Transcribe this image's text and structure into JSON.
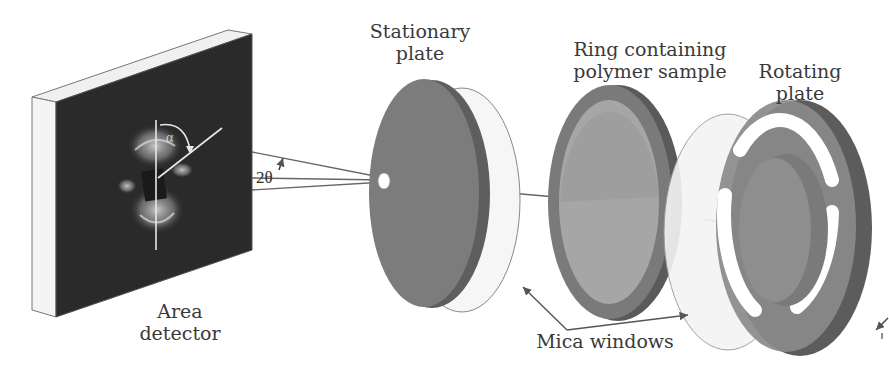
{
  "diagram": {
    "type": "schematic",
    "labels": {
      "area_detector": [
        "Area",
        "detector"
      ],
      "stationary_plate": [
        "Stationary",
        "plate"
      ],
      "ring": [
        "Ring containing",
        "polymer sample"
      ],
      "rotating_plate": [
        "Rotating",
        "plate"
      ],
      "mica_windows": "Mica windows"
    },
    "symbols": {
      "two_theta": "2θ",
      "alpha": "α"
    },
    "colors": {
      "detector_face": "#2a2a2a",
      "detector_edge": "#f2f2f2",
      "plate_dark": "#6e6e6e",
      "plate_mid": "#8a8a8a",
      "plate_light": "#a8a8a8",
      "mica": "#f4f4f4",
      "line": "#555555",
      "text": "#3a3a3a"
    }
  }
}
